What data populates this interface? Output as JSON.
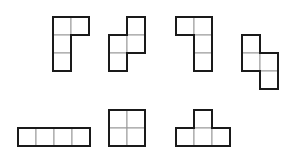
{
  "diagram": {
    "title": "",
    "cell_size": 18,
    "inner_line_color": "#9a9a9a",
    "outer_line_color": "#1a1a1a",
    "shapes": [
      {
        "name": "tetromino-p-top-right",
        "cells": [
          [
            53,
            17
          ],
          [
            71,
            17
          ],
          [
            53,
            35
          ],
          [
            53,
            53
          ]
        ]
      },
      {
        "name": "tetromino-s-vertical",
        "cells": [
          [
            127,
            17
          ],
          [
            109,
            35
          ],
          [
            127,
            35
          ],
          [
            109,
            53
          ]
        ]
      },
      {
        "name": "tetromino-l-top-left",
        "cells": [
          [
            176,
            17
          ],
          [
            194,
            17
          ],
          [
            194,
            35
          ],
          [
            194,
            53
          ]
        ]
      },
      {
        "name": "tetromino-z-vertical",
        "cells": [
          [
            242,
            35
          ],
          [
            242,
            53
          ],
          [
            260,
            53
          ],
          [
            260,
            71
          ]
        ]
      },
      {
        "name": "tetromino-i-horizontal",
        "cells": [
          [
            18,
            128
          ],
          [
            36,
            128
          ],
          [
            54,
            128
          ],
          [
            72,
            128
          ]
        ]
      },
      {
        "name": "tetromino-o-square",
        "cells": [
          [
            109,
            110
          ],
          [
            127,
            110
          ],
          [
            109,
            128
          ],
          [
            127,
            128
          ]
        ]
      },
      {
        "name": "tetromino-t-up",
        "cells": [
          [
            194,
            110
          ],
          [
            176,
            128
          ],
          [
            194,
            128
          ],
          [
            212,
            128
          ]
        ]
      }
    ]
  }
}
